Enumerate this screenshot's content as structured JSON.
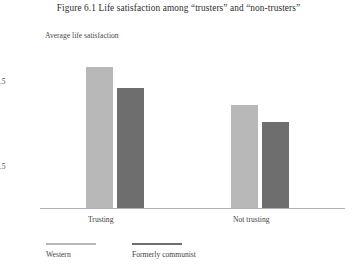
{
  "chart_data": {
    "type": "bar",
    "title": "Figure 6.1  Life satisfaction among “trusters” and “non-trusters”",
    "ylabel": "Average life satisfaction",
    "xlabel": "",
    "categories": [
      "Trusting",
      "Not trusting"
    ],
    "series": [
      {
        "name": "Western",
        "color": "#b8b8b8",
        "values": [
          7.65,
          7.2
        ]
      },
      {
        "name": "Formerly communist",
        "color": "#6e6e6e",
        "values": [
          7.4,
          7.0
        ]
      }
    ],
    "ylim": [
      6,
      8
    ],
    "yticks": [
      8,
      7.5,
      7,
      6.5,
      6
    ],
    "ytick_labels": [
      "8",
      "7.5",
      "7",
      "6.5",
      "6"
    ],
    "grid": false,
    "legend_position": "bottom-left"
  },
  "figure": {
    "title": "Figure 6.1  Life satisfaction among “trusters” and “non-trusters”",
    "axis_caption": "Average life satisfaction"
  },
  "legend": {
    "entries": [
      {
        "label": "Western",
        "color": "#b8b8b8"
      },
      {
        "label": "Formerly communist",
        "color": "#6e6e6e"
      }
    ]
  }
}
